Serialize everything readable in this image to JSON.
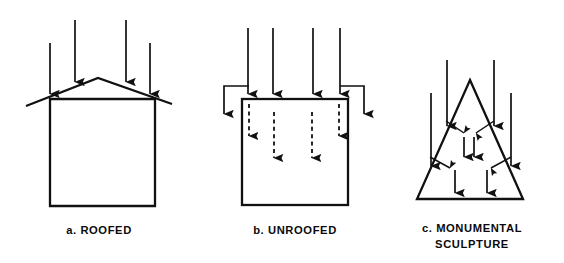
{
  "figure": {
    "background_color": "#ffffff",
    "ink_color": "#111111",
    "panels": [
      {
        "id": "roofed",
        "caption": "a. ROOFED",
        "caption_lines": [
          "a. ROOFED"
        ],
        "shape": "house-with-gable-roof",
        "shape_outline": {
          "wall_box": {
            "x": 50,
            "y": 99,
            "width": 105,
            "height": 107
          },
          "roof_apex": {
            "x": 98,
            "y": 78
          },
          "roof_left_eave": {
            "x": 26,
            "y": 106
          },
          "roof_right_eave": {
            "x": 172,
            "y": 104
          }
        },
        "incident_arrows": [
          {
            "x": 50,
            "y_start": 43,
            "y_end": 94,
            "style": "solid"
          },
          {
            "x": 75,
            "y_start": 20,
            "y_end": 82,
            "style": "solid"
          },
          {
            "x": 126,
            "y_start": 20,
            "y_end": 82,
            "style": "solid"
          },
          {
            "x": 150,
            "y_start": 43,
            "y_end": 94,
            "style": "solid"
          }
        ],
        "interior_arrows": [],
        "deflection_arrows": []
      },
      {
        "id": "unroofed",
        "caption": "b. UNROOFED",
        "caption_lines": [
          "b. UNROOFED"
        ],
        "shape": "open-top-box",
        "shape_outline": {
          "wall_box": {
            "x": 242,
            "y": 99,
            "width": 106,
            "height": 106
          }
        },
        "incident_arrows": [
          {
            "x": 248,
            "y_start": 28,
            "y_end": 94,
            "style": "solid"
          },
          {
            "x": 273,
            "y_start": 28,
            "y_end": 94,
            "style": "solid"
          },
          {
            "x": 313,
            "y_start": 28,
            "y_end": 94,
            "style": "solid"
          },
          {
            "x": 340,
            "y_start": 28,
            "y_end": 94,
            "style": "solid"
          }
        ],
        "interior_arrows": [
          {
            "x": 249,
            "y_start": 104,
            "y_end": 136,
            "style": "dashed"
          },
          {
            "x": 274,
            "y_start": 112,
            "y_end": 158,
            "style": "dashed"
          },
          {
            "x": 312,
            "y_start": 112,
            "y_end": 158,
            "style": "dashed"
          },
          {
            "x": 339,
            "y_start": 104,
            "y_end": 136,
            "style": "dashed"
          }
        ],
        "deflection_arrows": [
          {
            "side": "left",
            "from_x": 249,
            "from_y": 86,
            "corner_x": 224,
            "corner_y": 86,
            "to_y": 114
          },
          {
            "side": "right",
            "from_x": 340,
            "from_y": 86,
            "corner_x": 364,
            "corner_y": 86,
            "to_y": 114
          }
        ]
      },
      {
        "id": "monumental-sculpture",
        "caption": "c. MONUMENTAL SCULPTURE",
        "caption_lines": [
          "c. MONUMENTAL",
          "SCULPTURE"
        ],
        "shape": "triangle",
        "shape_outline": {
          "apex": {
            "x": 470,
            "y": 80
          },
          "base_left": {
            "x": 417,
            "y": 199
          },
          "base_right": {
            "x": 523,
            "y": 199
          }
        },
        "incident_arrows": [
          {
            "x": 431,
            "y_start": 93,
            "y_end": 166,
            "style": "solid"
          },
          {
            "x": 447,
            "y_start": 60,
            "y_end": 126,
            "style": "solid"
          },
          {
            "x": 494,
            "y_start": 60,
            "y_end": 126,
            "style": "solid"
          },
          {
            "x": 511,
            "y_start": 93,
            "y_end": 166,
            "style": "solid"
          }
        ],
        "interior_arrows": [
          {
            "x": 464,
            "y_start": 137,
            "y_end": 157,
            "style": "solid"
          },
          {
            "x": 473,
            "y_start": 137,
            "y_end": 157,
            "style": "solid"
          },
          {
            "x": 455,
            "y_start": 170,
            "y_end": 193,
            "style": "solid"
          },
          {
            "x": 487,
            "y_start": 170,
            "y_end": 193,
            "style": "solid"
          }
        ],
        "deflection_arrows": [
          {
            "from_x": 446,
            "from_y": 121,
            "to_x": 464,
            "to_y": 133,
            "label": "upper-left-inward"
          },
          {
            "from_x": 494,
            "from_y": 121,
            "to_x": 476,
            "to_y": 133,
            "label": "upper-right-inward"
          },
          {
            "from_x": 430,
            "from_y": 157,
            "to_x": 450,
            "to_y": 168,
            "label": "lower-left-inward"
          },
          {
            "from_x": 511,
            "from_y": 157,
            "to_x": 491,
            "to_y": 168,
            "label": "lower-right-inward"
          }
        ]
      }
    ],
    "caption_positions": [
      {
        "x": 99,
        "y": 234
      },
      {
        "x": 295,
        "y": 234
      },
      {
        "x": 472,
        "y": 232
      },
      {
        "x": 472,
        "y": 248
      }
    ]
  }
}
